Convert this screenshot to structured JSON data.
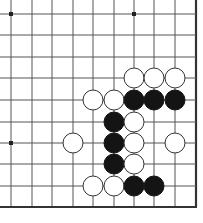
{
  "board": {
    "width": 203,
    "height": 223,
    "background": "#ffffff",
    "line_color": "#555555",
    "edge_color": "#333333",
    "columns_x": [
      11,
      32,
      52,
      73,
      93,
      114,
      134,
      154,
      175,
      196
    ],
    "rows_y": [
      14,
      35,
      57,
      78,
      100,
      122,
      143,
      164,
      186,
      207
    ],
    "open_left": true,
    "open_top": true,
    "edge_right": true,
    "edge_bottom": true,
    "stone_radius": 10,
    "star_points": [
      {
        "col": 0,
        "row": 0
      },
      {
        "col": 6,
        "row": 0
      },
      {
        "col": 0,
        "row": 6
      }
    ],
    "stones": [
      {
        "color": "white",
        "col": 6,
        "row": 3
      },
      {
        "color": "white",
        "col": 7,
        "row": 3
      },
      {
        "color": "white",
        "col": 8,
        "row": 3
      },
      {
        "color": "white",
        "col": 4,
        "row": 4
      },
      {
        "color": "white",
        "col": 5,
        "row": 4
      },
      {
        "color": "black",
        "col": 6,
        "row": 4
      },
      {
        "color": "black",
        "col": 7,
        "row": 4
      },
      {
        "color": "black",
        "col": 8,
        "row": 4
      },
      {
        "color": "black",
        "col": 5,
        "row": 5
      },
      {
        "color": "white",
        "col": 6,
        "row": 5
      },
      {
        "color": "white",
        "col": 3,
        "row": 6
      },
      {
        "color": "black",
        "col": 5,
        "row": 6
      },
      {
        "color": "white",
        "col": 6,
        "row": 6
      },
      {
        "color": "white",
        "col": 8,
        "row": 6
      },
      {
        "color": "black",
        "col": 5,
        "row": 7
      },
      {
        "color": "white",
        "col": 6,
        "row": 7
      },
      {
        "color": "white",
        "col": 4,
        "row": 8
      },
      {
        "color": "white",
        "col": 5,
        "row": 8
      },
      {
        "color": "black",
        "col": 6,
        "row": 8
      },
      {
        "color": "black",
        "col": 7,
        "row": 8
      }
    ]
  }
}
